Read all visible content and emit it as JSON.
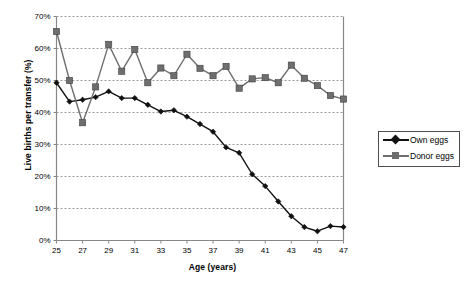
{
  "chart_data": {
    "type": "line",
    "title": "",
    "xlabel": "Age (years)",
    "ylabel": "Live births per transfer (%)",
    "x": [
      25,
      26,
      27,
      28,
      29,
      30,
      31,
      32,
      33,
      34,
      35,
      36,
      37,
      38,
      39,
      40,
      41,
      42,
      43,
      44,
      45,
      46,
      47
    ],
    "xlim": [
      25,
      47
    ],
    "ylim": [
      0,
      70
    ],
    "ytick_labels": [
      "0%",
      "10%",
      "20%",
      "30%",
      "40%",
      "50%",
      "60%",
      "70%"
    ],
    "ytick_values": [
      0,
      10,
      20,
      30,
      40,
      50,
      60,
      70
    ],
    "xtick_labels": [
      "25",
      "27",
      "29",
      "31",
      "33",
      "35",
      "37",
      "39",
      "41",
      "43",
      "45",
      "47"
    ],
    "xtick_values": [
      25,
      27,
      29,
      31,
      33,
      35,
      37,
      39,
      41,
      43,
      45,
      47
    ],
    "grid": "horizontal-dashed",
    "legend_position": "right-outside",
    "series": [
      {
        "name": "Own eggs",
        "marker": "diamond",
        "color": "#111111",
        "values": [
          49.3,
          43.4,
          44.0,
          44.8,
          46.6,
          44.5,
          44.5,
          42.4,
          40.3,
          40.7,
          38.7,
          36.4,
          34.0,
          29.1,
          27.4,
          20.7,
          17.0,
          12.2,
          7.6,
          4.2,
          2.9,
          4.5,
          4.2
        ]
      },
      {
        "name": "Donor eggs",
        "marker": "square",
        "color": "#6e6e6e",
        "values": [
          65.3,
          50.0,
          36.8,
          48.0,
          61.3,
          52.9,
          59.7,
          49.3,
          53.9,
          51.5,
          58.2,
          53.8,
          51.5,
          54.4,
          47.6,
          50.5,
          50.9,
          49.3,
          54.8,
          50.7,
          48.4,
          45.3,
          44.2
        ]
      }
    ]
  },
  "legend": {
    "items": [
      {
        "label": "Own eggs"
      },
      {
        "label": "Donor eggs"
      }
    ]
  },
  "axes": {
    "y_title": "Live births per transfer (%)",
    "x_title": "Age (years)"
  },
  "colors": {
    "own_eggs": "#111111",
    "donor_eggs": "#6e6e6e",
    "axis": "#888888",
    "grid": "#9a9a9a",
    "frame": "#4d4d4d"
  }
}
